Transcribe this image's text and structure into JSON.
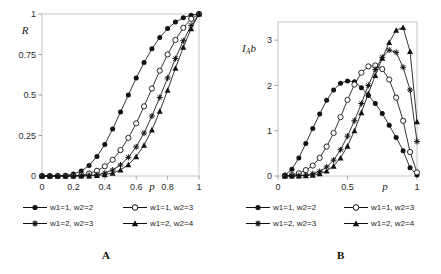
{
  "figure": {
    "panel_a_letter": "A",
    "panel_b_letter": "B"
  },
  "legend": {
    "series_labels": [
      "w1=1, w2=2",
      "w1=1, w2=3",
      "w1=2, w2=3",
      "w1=2, w2=4"
    ],
    "markers": [
      "filled-circle",
      "open-circle",
      "star",
      "filled-triangle"
    ]
  },
  "chart_data": [
    {
      "type": "line",
      "panel": "A",
      "title": "",
      "xlabel": "p",
      "ylabel": "R",
      "xlim": [
        0,
        1
      ],
      "ylim": [
        0,
        1
      ],
      "xticks": [
        0,
        0.2,
        0.4,
        0.6,
        0.8,
        1
      ],
      "xticklabels": [
        "0",
        "0.2",
        "0.4",
        "0.6",
        "0.8",
        "1"
      ],
      "yticks": [
        0,
        0.25,
        0.5,
        0.75,
        1
      ],
      "yticklabels": [
        "0",
        "0.25",
        "0.5",
        "0.75",
        "1"
      ],
      "grid": false,
      "legend_position": "below",
      "x": [
        0,
        0.05,
        0.1,
        0.15,
        0.2,
        0.25,
        0.3,
        0.35,
        0.4,
        0.45,
        0.5,
        0.55,
        0.6,
        0.65,
        0.7,
        0.75,
        0.8,
        0.85,
        0.9,
        0.95,
        1
      ],
      "series": [
        {
          "name": "w1=1, w2=2",
          "marker": "filled-circle",
          "values": [
            0,
            0,
            0.001,
            0.004,
            0.012,
            0.031,
            0.065,
            0.12,
            0.195,
            0.29,
            0.395,
            0.5,
            0.605,
            0.7,
            0.785,
            0.855,
            0.91,
            0.95,
            0.977,
            0.993,
            1
          ]
        },
        {
          "name": "w1=1, w2=3",
          "marker": "open-circle",
          "values": [
            0,
            0,
            0,
            0,
            0.002,
            0.006,
            0.015,
            0.032,
            0.06,
            0.1,
            0.16,
            0.235,
            0.325,
            0.43,
            0.54,
            0.65,
            0.75,
            0.84,
            0.915,
            0.97,
            1
          ]
        },
        {
          "name": "w1=2, w2=3",
          "marker": "star",
          "values": [
            0,
            0,
            0,
            0,
            0,
            0.001,
            0.003,
            0.008,
            0.018,
            0.037,
            0.068,
            0.115,
            0.18,
            0.265,
            0.37,
            0.485,
            0.605,
            0.725,
            0.835,
            0.93,
            1
          ]
        },
        {
          "name": "w1=2, w2=4",
          "marker": "filled-triangle",
          "values": [
            0,
            0,
            0,
            0,
            0,
            0,
            0.001,
            0.003,
            0.008,
            0.018,
            0.037,
            0.07,
            0.12,
            0.19,
            0.285,
            0.4,
            0.53,
            0.665,
            0.795,
            0.91,
            1
          ]
        }
      ]
    },
    {
      "type": "line",
      "panel": "B",
      "title": "",
      "xlabel": "p",
      "ylabel": "I_A b",
      "xlim": [
        0,
        1
      ],
      "ylim": [
        0,
        3.4
      ],
      "xticks": [
        0,
        0.5,
        1
      ],
      "xticklabels": [
        "0",
        "0.5",
        "1"
      ],
      "yticks": [
        0,
        1,
        2,
        3
      ],
      "yticklabels": [
        "0",
        "1",
        "2",
        "3"
      ],
      "grid": false,
      "legend_position": "below",
      "x": [
        0.05,
        0.1,
        0.15,
        0.2,
        0.25,
        0.3,
        0.35,
        0.4,
        0.45,
        0.5,
        0.55,
        0.6,
        0.65,
        0.7,
        0.75,
        0.8,
        0.85,
        0.9,
        0.95,
        1
      ],
      "series": [
        {
          "name": "w1=1, w2=2",
          "marker": "filled-circle",
          "values": [
            0.02,
            0.15,
            0.4,
            0.72,
            1.05,
            1.37,
            1.67,
            1.9,
            2.05,
            2.1,
            2.08,
            1.95,
            1.78,
            1.6,
            1.38,
            1.12,
            0.85,
            0.56,
            0.18,
            0.02
          ]
        },
        {
          "name": "w1=1, w2=3",
          "marker": "open-circle",
          "values": [
            0.0,
            0.02,
            0.06,
            0.13,
            0.23,
            0.4,
            0.65,
            0.95,
            1.3,
            1.68,
            2.02,
            2.28,
            2.42,
            2.44,
            2.36,
            2.13,
            1.73,
            1.22,
            0.53,
            0.08
          ]
        },
        {
          "name": "w1=2, w2=3",
          "marker": "star",
          "values": [
            0.0,
            0.0,
            0.01,
            0.02,
            0.05,
            0.1,
            0.2,
            0.35,
            0.58,
            0.88,
            1.22,
            1.6,
            2.0,
            2.35,
            2.62,
            2.78,
            2.73,
            2.4,
            1.9,
            0.76
          ]
        },
        {
          "name": "w1=2, w2=4",
          "marker": "filled-triangle",
          "values": [
            0.0,
            0.0,
            0.0,
            0.01,
            0.02,
            0.05,
            0.11,
            0.22,
            0.4,
            0.66,
            1.0,
            1.4,
            1.82,
            2.22,
            2.6,
            2.95,
            3.22,
            3.28,
            2.75,
            1.2
          ]
        }
      ]
    }
  ]
}
